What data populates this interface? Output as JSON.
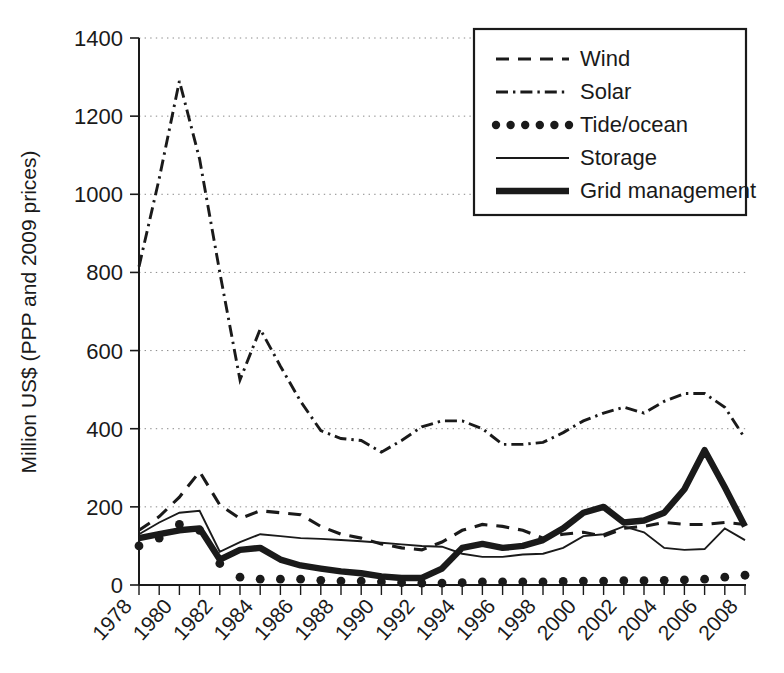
{
  "chart_data": {
    "type": "line",
    "title": "",
    "xlabel": "",
    "ylabel": "Million US$ (PPP and 2009 prices)",
    "xlim": [
      1978,
      2008
    ],
    "ylim": [
      0,
      1400
    ],
    "yticks": [
      0,
      200,
      400,
      600,
      800,
      1000,
      1200,
      1400
    ],
    "xticks_labeled": [
      1978,
      1980,
      1982,
      1984,
      1986,
      1988,
      1990,
      1992,
      1994,
      1996,
      1998,
      2000,
      2002,
      2004,
      2006,
      2008
    ],
    "xticks_all": [
      1978,
      1979,
      1980,
      1981,
      1982,
      1983,
      1984,
      1985,
      1986,
      1987,
      1988,
      1989,
      1990,
      1991,
      1992,
      1993,
      1994,
      1995,
      1996,
      1997,
      1998,
      1999,
      2000,
      2001,
      2002,
      2003,
      2004,
      2005,
      2006,
      2007,
      2008
    ],
    "grid": "horizontal-dotted",
    "legend_position": "top-right",
    "x": [
      1978,
      1979,
      1980,
      1981,
      1982,
      1983,
      1984,
      1985,
      1986,
      1987,
      1988,
      1989,
      1990,
      1991,
      1992,
      1993,
      1994,
      1995,
      1996,
      1997,
      1998,
      1999,
      2000,
      2001,
      2002,
      2003,
      2004,
      2005,
      2006,
      2007,
      2008
    ],
    "series": [
      {
        "name": "Wind",
        "style": "dashed",
        "values": [
          140,
          175,
          225,
          290,
          205,
          170,
          190,
          185,
          180,
          150,
          130,
          120,
          105,
          95,
          90,
          110,
          140,
          155,
          150,
          140,
          120,
          130,
          135,
          125,
          145,
          150,
          160,
          155,
          155,
          160,
          155
        ]
      },
      {
        "name": "Solar",
        "style": "dash-dot",
        "values": [
          815,
          1040,
          1290,
          1090,
          800,
          525,
          655,
          560,
          470,
          395,
          375,
          370,
          340,
          370,
          405,
          420,
          420,
          400,
          360,
          360,
          365,
          390,
          420,
          440,
          455,
          440,
          470,
          490,
          490,
          455,
          375
        ]
      },
      {
        "name": "Tide/ocean",
        "style": "dotted",
        "values": [
          100,
          120,
          155,
          140,
          55,
          20,
          15,
          15,
          15,
          12,
          10,
          10,
          8,
          6,
          5,
          5,
          6,
          8,
          8,
          8,
          8,
          9,
          10,
          10,
          11,
          11,
          12,
          13,
          15,
          20,
          25
        ]
      },
      {
        "name": "Storage",
        "style": "thin-solid",
        "values": [
          130,
          160,
          185,
          190,
          85,
          110,
          130,
          125,
          120,
          118,
          115,
          112,
          108,
          104,
          100,
          98,
          80,
          72,
          72,
          78,
          80,
          95,
          125,
          130,
          150,
          135,
          95,
          90,
          92,
          145,
          115
        ]
      },
      {
        "name": "Grid management",
        "style": "thick-solid",
        "values": [
          120,
          130,
          140,
          145,
          65,
          90,
          95,
          65,
          50,
          42,
          35,
          30,
          22,
          18,
          18,
          42,
          95,
          105,
          95,
          100,
          115,
          145,
          185,
          200,
          160,
          165,
          185,
          245,
          345,
          250,
          150
        ]
      }
    ]
  },
  "legend": {
    "items": [
      {
        "label": "Wind",
        "style": "dashed"
      },
      {
        "label": "Solar",
        "style": "dash-dot"
      },
      {
        "label": "Tide/ocean",
        "style": "dotted"
      },
      {
        "label": "Storage",
        "style": "thin-solid"
      },
      {
        "label": "Grid management",
        "style": "thick-solid"
      }
    ]
  },
  "axes": {
    "y_title": "Million US$ (PPP and 2009 prices)"
  }
}
